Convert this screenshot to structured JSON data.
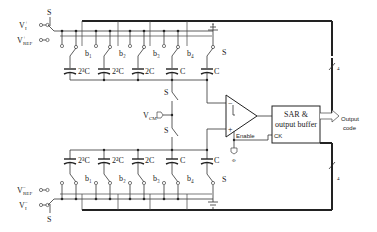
{
  "diagram": {
    "inputs_top": {
      "vin_label": "V",
      "vin_sup": "+",
      "vin_sub": "I",
      "vref_label": "V",
      "vref_sup": "+",
      "vref_sub": "REF",
      "switch_label": "S"
    },
    "inputs_bottom": {
      "vin_label": "V",
      "vin_sup": "−",
      "vin_sub": "I",
      "vref_label": "V",
      "vref_sup": "−",
      "vref_sub": "REF",
      "switch_label": "S"
    },
    "top_array": {
      "capacitors": [
        "2³C",
        "2²C",
        "2C",
        "C",
        "C"
      ],
      "bit_switches": [
        "b₁",
        "b₂",
        "b₃",
        "b₄",
        "S"
      ]
    },
    "bottom_array": {
      "capacitors": [
        "2³C",
        "2²C",
        "2C",
        "C",
        "C"
      ],
      "bit_switches": [
        "b₁",
        "b₂",
        "b₃",
        "b₄",
        "S"
      ]
    },
    "vcm": {
      "label": "V",
      "sub": "CM",
      "switch_top": "S",
      "switch_bottom": "S"
    },
    "comparator": {
      "minus": "−",
      "plus": "+",
      "enable_label": "Enable",
      "clock_label": "Φ"
    },
    "sar_block": {
      "line1": "SAR &",
      "line2": "output buffer",
      "ck_label": "CK"
    },
    "output": {
      "line1": "Output",
      "line2": "code"
    },
    "bus_width_top": "4",
    "bus_width_bottom": "4"
  }
}
